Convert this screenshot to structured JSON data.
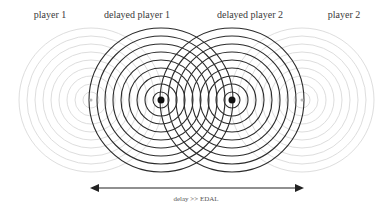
{
  "labels": {
    "player1": "player 1",
    "delayed_player1": "delayed player 1",
    "delayed_player2": "delayed player 2",
    "player2": "player 2"
  },
  "caption": "delay >> EDAL",
  "sources": [
    {
      "name": "player 1",
      "cx": 91,
      "cy": 100,
      "style": "faint"
    },
    {
      "name": "delayed player 1",
      "cx": 161,
      "cy": 100,
      "style": "dark"
    },
    {
      "name": "delayed player 2",
      "cx": 232,
      "cy": 100,
      "style": "dark"
    },
    {
      "name": "player 2",
      "cx": 302,
      "cy": 100,
      "style": "faint"
    }
  ],
  "ring_radii": [
    8,
    16,
    24,
    32,
    40,
    48,
    56,
    64,
    72
  ],
  "colors": {
    "dark_ring": "#2b2b2b",
    "faint_ring": "#d9d9d9",
    "dot": "#111111",
    "arrow": "#222222"
  },
  "arrow": {
    "x1": 90,
    "x2": 304,
    "y": 188
  }
}
